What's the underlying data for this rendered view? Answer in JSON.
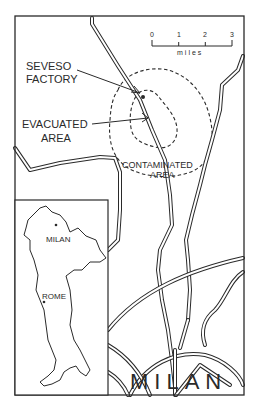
{
  "map": {
    "labels": {
      "factory": [
        "SEVESO",
        "FACTORY"
      ],
      "evacuated": [
        "EVACUATED",
        "AREA"
      ],
      "contaminated": [
        "CONTAMINATED",
        "AREA"
      ],
      "city": "MILAN"
    },
    "scale_bar": {
      "ticks": [
        "0",
        "1",
        "2",
        "3"
      ],
      "unit": "miles"
    },
    "inset": {
      "cities": [
        {
          "name": "MILAN"
        },
        {
          "name": "ROME"
        }
      ]
    },
    "colors": {
      "line": "#2a2a2a",
      "contaminated_fill": "#e6e6e6",
      "evacuated_fill": "#d4d4d4",
      "background": "#ffffff"
    }
  }
}
